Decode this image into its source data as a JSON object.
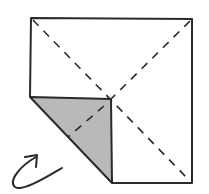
{
  "diagram": {
    "type": "origami-fold-step",
    "colors": {
      "paper": "#ffffff",
      "line": "#2a2a2a",
      "flap_fill": "#b9b9b9",
      "background": "#ffffff"
    },
    "paper_square": {
      "top_left": [
        31,
        18
      ],
      "top_right": [
        192,
        19
      ],
      "bottom_right": [
        192,
        183
      ],
      "left_mid": [
        30,
        97
      ]
    },
    "folded_flap": {
      "points": [
        [
          30,
          97
        ],
        [
          111,
          99
        ],
        [
          112,
          183
        ]
      ]
    },
    "fold_lines": [
      {
        "style": "dashed",
        "from": [
          31,
          18
        ],
        "to": [
          192,
          183
        ],
        "label": "valley-diagonal-1"
      },
      {
        "style": "dashed",
        "from": [
          192,
          19
        ],
        "to": [
          68,
          137
        ],
        "label": "valley-diagonal-2"
      }
    ],
    "arrow": {
      "meaning": "turn-over",
      "path": "M62,168 C45,178 22,190 16,185 C8,178 20,165 36,157",
      "head": [
        [
          26,
          157
        ],
        [
          37,
          156
        ],
        [
          36,
          167
        ]
      ]
    }
  }
}
